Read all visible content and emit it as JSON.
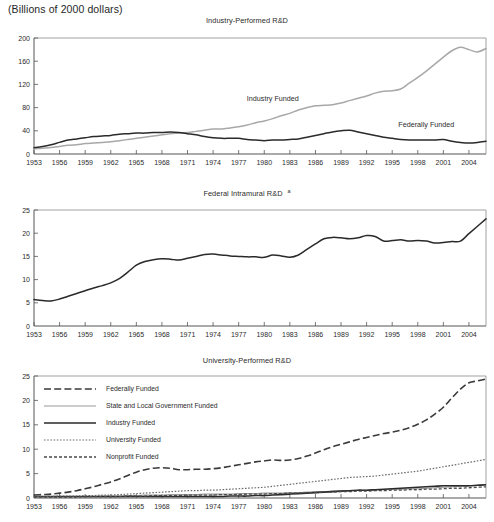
{
  "header": {
    "units_note": "(Billions of 2000 dollars)"
  },
  "charts": [
    {
      "id": "industry-performed",
      "title": "Industry-Performed R&D",
      "footnote_marker": "",
      "ylim": [
        0,
        200
      ],
      "yticks": [
        0,
        40,
        80,
        120,
        160,
        200
      ],
      "xlim": [
        1953,
        2006
      ],
      "xticks": [
        1953,
        1956,
        1959,
        1962,
        1965,
        1968,
        1971,
        1974,
        1977,
        1980,
        1983,
        1986,
        1989,
        1992,
        1995,
        1998,
        2001,
        2004
      ],
      "inline_labels": [
        {
          "text": "Industry Funded",
          "x": 1981,
          "y": 92
        },
        {
          "text": "Federally Funded",
          "x": 1999,
          "y": 46
        }
      ]
    },
    {
      "id": "federal-intramural",
      "title": "Federal Intramural R&D",
      "footnote_marker": "a",
      "ylim": [
        0,
        25
      ],
      "yticks": [
        0,
        5,
        10,
        15,
        20,
        25
      ],
      "xlim": [
        1953,
        2006
      ],
      "xticks": [
        1953,
        1956,
        1959,
        1962,
        1965,
        1968,
        1971,
        1974,
        1977,
        1980,
        1983,
        1986,
        1989,
        1992,
        1995,
        1998,
        2001,
        2004
      ],
      "inline_labels": []
    },
    {
      "id": "university-performed",
      "title": "University-Performed R&D",
      "footnote_marker": "",
      "ylim": [
        0,
        25
      ],
      "yticks": [
        0,
        5,
        10,
        15,
        20,
        25
      ],
      "xlim": [
        1953,
        2006
      ],
      "xticks": [
        1953,
        1956,
        1959,
        1962,
        1965,
        1968,
        1971,
        1974,
        1977,
        1980,
        1983,
        1986,
        1989,
        1992,
        1995,
        1998,
        2001,
        2004
      ],
      "inline_labels": [],
      "legend": [
        {
          "label": "Federally Funded",
          "style": "long-dash",
          "color": "#3a3a3a"
        },
        {
          "label": "State and Local Government Funded",
          "style": "thin-solid",
          "color": "#9a9a9a"
        },
        {
          "label": "Industry Funded",
          "style": "thick-solid",
          "color": "#2a2a2a"
        },
        {
          "label": "University Funded",
          "style": "dotted",
          "color": "#6b6b6b"
        },
        {
          "label": "Nonprofit Funded",
          "style": "short-dash",
          "color": "#4a4a4a"
        }
      ]
    }
  ],
  "chart_data": [
    {
      "type": "line",
      "title": "Industry-Performed R&D",
      "subtitle": "(Billions of 2000 dollars)",
      "xlabel": "",
      "ylabel": "",
      "ylim": [
        0,
        200
      ],
      "xlim": [
        1953,
        2006
      ],
      "grid": false,
      "legend": "inline annotations",
      "x": [
        1953,
        1954,
        1955,
        1956,
        1957,
        1958,
        1959,
        1960,
        1961,
        1962,
        1963,
        1964,
        1965,
        1966,
        1967,
        1968,
        1969,
        1970,
        1971,
        1972,
        1973,
        1974,
        1975,
        1976,
        1977,
        1978,
        1979,
        1980,
        1981,
        1982,
        1983,
        1984,
        1985,
        1986,
        1987,
        1988,
        1989,
        1990,
        1991,
        1992,
        1993,
        1994,
        1995,
        1996,
        1997,
        1998,
        1999,
        2000,
        2001,
        2002,
        2003,
        2004,
        2005,
        2006
      ],
      "series": [
        {
          "name": "Industry Funded",
          "values": [
            9,
            10,
            11,
            13,
            15,
            16,
            18,
            19,
            20,
            21,
            23,
            25,
            27,
            29,
            31,
            33,
            35,
            36,
            37,
            39,
            41,
            43,
            43,
            45,
            47,
            50,
            54,
            57,
            61,
            66,
            70,
            76,
            80,
            83,
            84,
            85,
            88,
            92,
            96,
            100,
            105,
            108,
            109,
            112,
            122,
            132,
            143,
            155,
            167,
            178,
            184,
            180,
            176,
            182
          ]
        },
        {
          "name": "Federally Funded",
          "values": [
            11,
            13,
            16,
            20,
            24,
            26,
            28,
            30,
            31,
            32,
            34,
            35,
            36,
            36,
            37,
            37,
            38,
            37,
            35,
            33,
            30,
            28,
            27,
            27,
            27,
            25,
            24,
            23,
            24,
            24,
            25,
            26,
            29,
            32,
            35,
            38,
            40,
            41,
            38,
            35,
            32,
            29,
            27,
            25,
            24,
            24,
            24,
            24,
            25,
            22,
            20,
            19,
            20,
            22
          ]
        }
      ]
    },
    {
      "type": "line",
      "title": "Federal Intramural R&D",
      "footnote": "a",
      "subtitle": "(Billions of 2000 dollars)",
      "xlabel": "",
      "ylabel": "",
      "ylim": [
        0,
        25
      ],
      "xlim": [
        1953,
        2006
      ],
      "grid": false,
      "x": [
        1953,
        1954,
        1955,
        1956,
        1957,
        1958,
        1959,
        1960,
        1961,
        1962,
        1963,
        1964,
        1965,
        1966,
        1967,
        1968,
        1969,
        1970,
        1971,
        1972,
        1973,
        1974,
        1975,
        1976,
        1977,
        1978,
        1979,
        1980,
        1981,
        1982,
        1983,
        1984,
        1985,
        1986,
        1987,
        1988,
        1989,
        1990,
        1991,
        1992,
        1993,
        1994,
        1995,
        1996,
        1997,
        1998,
        1999,
        2000,
        2001,
        2002,
        2003,
        2004,
        2005,
        2006
      ],
      "series": [
        {
          "name": "Federal Intramural R&D",
          "values": [
            5.7,
            5.5,
            5.4,
            5.8,
            6.4,
            7.0,
            7.6,
            8.2,
            8.7,
            9.3,
            10.2,
            11.6,
            13.1,
            13.9,
            14.3,
            14.5,
            14.4,
            14.2,
            14.6,
            15.0,
            15.4,
            15.5,
            15.3,
            15.1,
            15.0,
            14.9,
            14.9,
            14.8,
            15.3,
            15.1,
            14.8,
            15.3,
            16.5,
            17.7,
            18.8,
            19.1,
            19.0,
            18.8,
            19.0,
            19.5,
            19.3,
            18.3,
            18.4,
            18.6,
            18.3,
            18.4,
            18.3,
            17.9,
            18.0,
            18.2,
            18.3,
            19.9,
            21.5,
            23.1
          ]
        }
      ]
    },
    {
      "type": "line",
      "title": "University-Performed R&D",
      "subtitle": "(Billions of 2000 dollars)",
      "xlabel": "",
      "ylabel": "",
      "ylim": [
        0,
        25
      ],
      "xlim": [
        1953,
        2006
      ],
      "grid": false,
      "legend": "top-left inside plot",
      "x": [
        1953,
        1954,
        1955,
        1956,
        1957,
        1958,
        1959,
        1960,
        1961,
        1962,
        1963,
        1964,
        1965,
        1966,
        1967,
        1968,
        1969,
        1970,
        1971,
        1972,
        1973,
        1974,
        1975,
        1976,
        1977,
        1978,
        1979,
        1980,
        1981,
        1982,
        1983,
        1984,
        1985,
        1986,
        1987,
        1988,
        1989,
        1990,
        1991,
        1992,
        1993,
        1994,
        1995,
        1996,
        1997,
        1998,
        1999,
        2000,
        2001,
        2002,
        2003,
        2004,
        2005,
        2006
      ],
      "series": [
        {
          "name": "Federally Funded",
          "values": [
            0.6,
            0.7,
            0.8,
            1.0,
            1.2,
            1.5,
            1.9,
            2.3,
            2.8,
            3.3,
            3.9,
            4.6,
            5.3,
            5.8,
            6.1,
            6.2,
            6.1,
            5.8,
            5.8,
            5.9,
            5.9,
            6.0,
            6.2,
            6.5,
            6.8,
            7.1,
            7.4,
            7.6,
            7.8,
            7.7,
            7.8,
            8.1,
            8.6,
            9.2,
            9.9,
            10.5,
            11.0,
            11.5,
            12.0,
            12.4,
            12.8,
            13.2,
            13.5,
            13.9,
            14.4,
            15.1,
            16.0,
            17.2,
            18.6,
            20.5,
            22.3,
            23.6,
            24.0,
            24.4
          ]
        },
        {
          "name": "State and Local Government Funded",
          "values": [
            0.2,
            0.2,
            0.2,
            0.2,
            0.3,
            0.3,
            0.3,
            0.3,
            0.4,
            0.4,
            0.4,
            0.5,
            0.5,
            0.6,
            0.6,
            0.6,
            0.7,
            0.7,
            0.7,
            0.7,
            0.8,
            0.8,
            0.8,
            0.8,
            0.9,
            0.9,
            0.9,
            1.0,
            1.0,
            1.0,
            1.1,
            1.1,
            1.2,
            1.3,
            1.3,
            1.4,
            1.5,
            1.5,
            1.6,
            1.6,
            1.7,
            1.7,
            1.8,
            1.8,
            1.9,
            1.9,
            2.0,
            2.1,
            2.2,
            2.3,
            2.4,
            2.5,
            2.6,
            2.7
          ]
        },
        {
          "name": "Industry Funded",
          "values": [
            0.3,
            0.3,
            0.3,
            0.3,
            0.3,
            0.3,
            0.3,
            0.3,
            0.3,
            0.3,
            0.3,
            0.3,
            0.3,
            0.3,
            0.3,
            0.3,
            0.3,
            0.3,
            0.3,
            0.3,
            0.3,
            0.3,
            0.3,
            0.4,
            0.4,
            0.4,
            0.5,
            0.5,
            0.6,
            0.7,
            0.8,
            0.9,
            1.0,
            1.1,
            1.2,
            1.3,
            1.4,
            1.5,
            1.6,
            1.6,
            1.7,
            1.8,
            1.9,
            2.0,
            2.1,
            2.2,
            2.3,
            2.4,
            2.5,
            2.5,
            2.5,
            2.5,
            2.6,
            2.7
          ]
        },
        {
          "name": "University Funded",
          "values": [
            0.3,
            0.3,
            0.3,
            0.4,
            0.4,
            0.4,
            0.5,
            0.5,
            0.6,
            0.6,
            0.7,
            0.8,
            0.9,
            1.0,
            1.1,
            1.2,
            1.3,
            1.4,
            1.5,
            1.5,
            1.6,
            1.6,
            1.7,
            1.8,
            1.9,
            2.0,
            2.1,
            2.2,
            2.4,
            2.6,
            2.8,
            3.0,
            3.2,
            3.4,
            3.6,
            3.8,
            4.0,
            4.2,
            4.3,
            4.4,
            4.5,
            4.7,
            4.9,
            5.1,
            5.3,
            5.5,
            5.8,
            6.1,
            6.4,
            6.7,
            7.0,
            7.3,
            7.6,
            7.9
          ]
        },
        {
          "name": "Nonprofit Funded",
          "values": [
            0.2,
            0.2,
            0.2,
            0.2,
            0.2,
            0.2,
            0.3,
            0.3,
            0.3,
            0.3,
            0.3,
            0.4,
            0.4,
            0.4,
            0.5,
            0.5,
            0.5,
            0.5,
            0.6,
            0.6,
            0.6,
            0.6,
            0.7,
            0.7,
            0.7,
            0.8,
            0.8,
            0.8,
            0.9,
            0.9,
            1.0,
            1.0,
            1.1,
            1.1,
            1.2,
            1.2,
            1.3,
            1.3,
            1.4,
            1.4,
            1.5,
            1.5,
            1.6,
            1.6,
            1.7,
            1.7,
            1.8,
            1.8,
            1.9,
            2.0,
            2.0,
            2.1,
            2.2,
            2.3
          ]
        }
      ]
    }
  ]
}
